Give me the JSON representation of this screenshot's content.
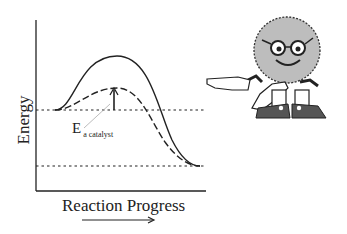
{
  "diagram": {
    "y_axis_label": "Energy",
    "x_axis_label": "Reaction Progress",
    "annotation": {
      "main": "E",
      "subscript": "a catalyst"
    },
    "curves": [
      {
        "name": "uncatalyzed",
        "style": "solid"
      },
      {
        "name": "catalyzed",
        "style": "dashed"
      }
    ],
    "levels": [
      {
        "name": "reactants",
        "style": "dotted"
      },
      {
        "name": "products",
        "style": "dotted"
      }
    ],
    "colors": {
      "line": "#222222",
      "character_fill": "#bdbdbd",
      "shoe": "#555555"
    }
  }
}
